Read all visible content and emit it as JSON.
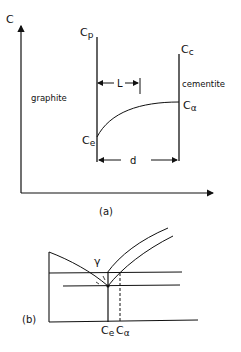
{
  "figure_a": {
    "y_axis_label": "C",
    "left_region_label": "graphite",
    "right_region_label": "cementite",
    "label_cp": "C",
    "label_cp_sub": "p",
    "label_cc": "C",
    "label_cc_sub": "c",
    "label_ce": "C",
    "label_ce_sub": "e",
    "label_ca": "C",
    "label_ca_sub": "α",
    "dim_L": "L",
    "dim_d": "d",
    "caption": "(a)"
  },
  "figure_b": {
    "phase_label": "γ",
    "label_ce": "C",
    "label_ce_sub": "e",
    "label_ca": "C",
    "label_ca_sub": "α",
    "caption": "(b)"
  }
}
